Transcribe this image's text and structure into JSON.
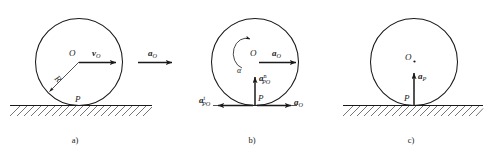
{
  "figure": {
    "background_color": "#ffffff",
    "ink_color": "#1a1a1a",
    "width": 495,
    "height": 156
  },
  "panels": [
    {
      "id": "a",
      "caption": "a)",
      "center_label": "O",
      "contact_label": "P",
      "radius_label": "R",
      "vectors": [
        {
          "name": "velocity-of-center",
          "symbol": "v",
          "subscript": "O",
          "superscript": "",
          "direction": "right"
        },
        {
          "name": "acceleration-of-center-external",
          "symbol": "a",
          "subscript": "O",
          "superscript": "",
          "direction": "right"
        }
      ],
      "ground": {
        "hatched": true
      }
    },
    {
      "id": "b",
      "caption": "b)",
      "center_label": "O",
      "contact_label": "P",
      "angular_accel_label": "α",
      "vectors": [
        {
          "name": "acceleration-of-center",
          "symbol": "a",
          "subscript": "O",
          "superscript": "",
          "direction": "right"
        },
        {
          "name": "normal-relative-acceleration",
          "symbol": "a",
          "subscript": "PO",
          "superscript": "n",
          "direction": "up"
        },
        {
          "name": "tangential-relative-acceleration",
          "symbol": "a",
          "subscript": "PO",
          "superscript": "t",
          "direction": "left"
        },
        {
          "name": "acceleration-of-center-at-contact",
          "symbol": "a",
          "subscript": "O",
          "superscript": "",
          "direction": "right"
        }
      ],
      "ground": {
        "hatched": false
      }
    },
    {
      "id": "c",
      "caption": "c)",
      "center_label": "O",
      "contact_label": "P",
      "vectors": [
        {
          "name": "acceleration-of-contact-point",
          "symbol": "a",
          "subscript": "P",
          "superscript": "",
          "direction": "up"
        }
      ],
      "ground": {
        "hatched": true
      }
    }
  ]
}
